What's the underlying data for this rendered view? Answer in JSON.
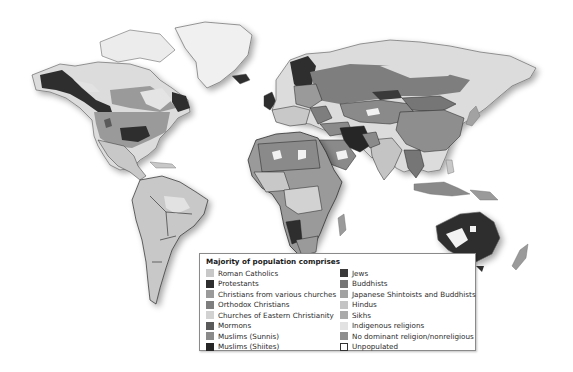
{
  "map": {
    "title": "World religions map",
    "colors": {
      "land_light": "#dcdcdc",
      "roman_catholic": "#c8c8c8",
      "protestant": "#2e2e2e",
      "christian_various": "#9a9a9a",
      "orthodox": "#7e7e7e",
      "eastern_churches": "#d2d2d2",
      "mormon": "#5a5a5a",
      "sunni": "#8a8a8a",
      "shiite": "#262626",
      "jews": "#3a3a3a",
      "buddhists": "#767676",
      "shinto": "#a2a2a2",
      "hindus": "#c4c4c4",
      "sikhs": "#aaaaaa",
      "indigenous": "#e2e2e2",
      "nonreligious": "#8e8e8e",
      "unpopulated": "#f2f2f2",
      "border": "#1e1e1e",
      "coast": "#6a6a6a"
    }
  },
  "legend": {
    "title": "Majority of population comprises",
    "left_items": [
      {
        "label": "Roman Catholics",
        "color": "#c8c8c8"
      },
      {
        "label": "Protestants",
        "color": "#2e2e2e"
      },
      {
        "label": "Christians from various churches",
        "color": "#9a9a9a"
      },
      {
        "label": "Orthodox Christians",
        "color": "#7e7e7e"
      },
      {
        "label": "Churches of Eastern Christianity",
        "color": "#d2d2d2"
      },
      {
        "label": "Mormons",
        "color": "#5a5a5a"
      },
      {
        "label": "Muslims (Sunnis)",
        "color": "#8a8a8a"
      },
      {
        "label": "Muslims (Shiites)",
        "color": "#262626"
      }
    ],
    "right_items": [
      {
        "label": "Jews",
        "color": "#3a3a3a"
      },
      {
        "label": "Buddhists",
        "color": "#767676"
      },
      {
        "label": "Japanese Shintoists and Buddhists",
        "color": "#a2a2a2"
      },
      {
        "label": "Hindus",
        "color": "#c4c4c4"
      },
      {
        "label": "Sikhs",
        "color": "#aaaaaa"
      },
      {
        "label": "Indigenous religions",
        "color": "#e2e2e2"
      },
      {
        "label": "No dominant religion/nonreligious",
        "color": "#8e8e8e"
      },
      {
        "label": "Unpopulated",
        "color": "#ffffff",
        "outline": true
      }
    ]
  }
}
